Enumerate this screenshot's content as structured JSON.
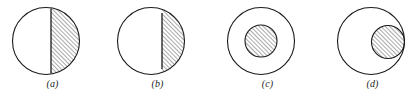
{
  "figure": {
    "background_color": "#ffffff",
    "stroke_color": "#1a1a1a",
    "hatch_color": "#2b2b2b",
    "panels": [
      {
        "id": "a",
        "label": "(a)",
        "description": "circle divided by a vertical chord, larger right region hatched",
        "outer_circle": {
          "cx": 46,
          "cy": 41,
          "r": 33.5
        },
        "chord_x": 51,
        "hatched_side": "right"
      },
      {
        "id": "b",
        "label": "(b)",
        "description": "circle divided by a vertical chord offset to the right, smaller right segment hatched",
        "outer_circle": {
          "cx": 46,
          "cy": 41,
          "r": 33.5
        },
        "chord_x": 57,
        "hatched_side": "right"
      },
      {
        "id": "c",
        "label": "(c)",
        "description": "concentric circles, smaller inner circle hatched",
        "outer_circle": {
          "cx": 46,
          "cy": 41,
          "r": 33.5
        },
        "inner_circle": {
          "cx": 46,
          "cy": 41,
          "r": 16
        },
        "hatched_region": "inner-circle"
      },
      {
        "id": "d",
        "label": "(d)",
        "description": "outer circle with an offset inner circle internally tangent at the right, inner circle hatched",
        "outer_circle": {
          "cx": 51,
          "cy": 41,
          "r": 33.5
        },
        "inner_circle": {
          "cx": 68,
          "cy": 42,
          "r": 16.5
        },
        "hatched_region": "inner-circle"
      }
    ],
    "hatching": {
      "angle_degrees": 45,
      "direction": "lower-left to upper-right",
      "spacing_px": 3,
      "line_width_px": 0.8
    }
  }
}
